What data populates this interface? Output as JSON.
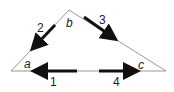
{
  "diagram": {
    "vertices": [
      {
        "id": "a",
        "label": "a"
      },
      {
        "id": "b",
        "label": "b"
      },
      {
        "id": "c",
        "label": "c"
      }
    ],
    "arrows": [
      {
        "id": "1",
        "label": "1",
        "direction": "left"
      },
      {
        "id": "2",
        "label": "2",
        "direction": "down-left"
      },
      {
        "id": "3",
        "label": "3",
        "direction": "down-right"
      },
      {
        "id": "4",
        "label": "4",
        "direction": "right"
      }
    ],
    "colors": {
      "line": "#888888",
      "arrow": "#111111",
      "text": "#222222"
    }
  }
}
